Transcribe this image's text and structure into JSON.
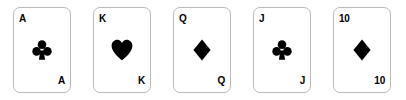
{
  "hand": {
    "background_color": "#ffffff",
    "card_border_color": "#b9b9b9",
    "ink_color": "#000000",
    "cards": [
      {
        "rank": "A",
        "suit": "clubs",
        "suit_icon": "club-suit-icon",
        "corner_top_left": "A",
        "corner_bottom_right": "A"
      },
      {
        "rank": "K",
        "suit": "hearts",
        "suit_icon": "heart-suit-icon",
        "corner_top_left": "K",
        "corner_bottom_right": "K"
      },
      {
        "rank": "Q",
        "suit": "diamonds",
        "suit_icon": "diamond-suit-icon",
        "corner_top_left": "Q",
        "corner_bottom_right": "Q"
      },
      {
        "rank": "J",
        "suit": "clubs",
        "suit_icon": "club-suit-icon",
        "corner_top_left": "J",
        "corner_bottom_right": "J"
      },
      {
        "rank": "10",
        "suit": "diamonds",
        "suit_icon": "diamond-suit-icon",
        "corner_top_left": "10",
        "corner_bottom_right": "10"
      }
    ]
  }
}
